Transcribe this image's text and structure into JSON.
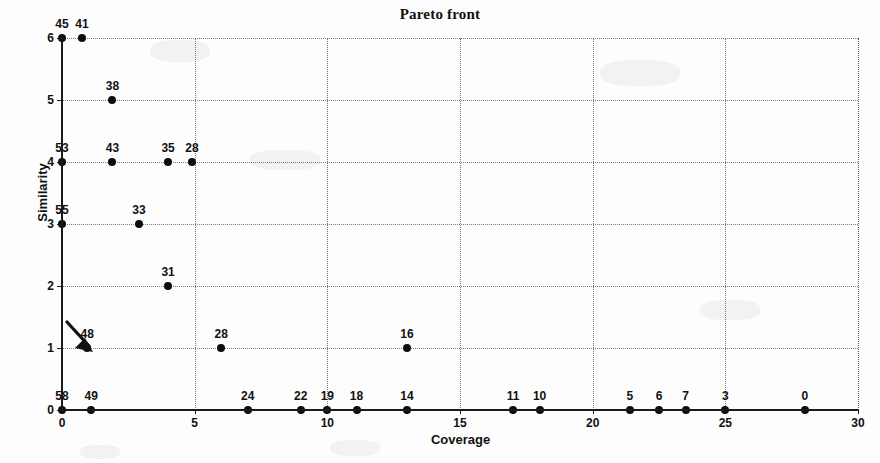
{
  "chart_data": {
    "type": "scatter",
    "title": "Pareto front",
    "xlabel": "Coverage",
    "ylabel": "Similarity",
    "xlim": [
      0,
      30
    ],
    "ylim": [
      0,
      6
    ],
    "xticks": [
      0,
      5,
      10,
      15,
      20,
      25,
      30
    ],
    "yticks": [
      0,
      1,
      2,
      3,
      4,
      5,
      6
    ],
    "xticklabels": [
      "0",
      "5",
      "10",
      "15",
      "20",
      "25",
      "30"
    ],
    "yticklabels": [
      "0",
      "1",
      "2",
      "3",
      "4",
      "5",
      "6"
    ],
    "grid": true,
    "grid_style": "dotted",
    "marker": "filled-circle",
    "marker_color": "#0d0d0d",
    "point_label_position": "above",
    "points": [
      {
        "label": "45",
        "x": 0,
        "y": 6
      },
      {
        "label": "41",
        "x": 0.75,
        "y": 6
      },
      {
        "label": "38",
        "x": 1.9,
        "y": 5
      },
      {
        "label": "53",
        "x": 0,
        "y": 4
      },
      {
        "label": "43",
        "x": 1.9,
        "y": 4
      },
      {
        "label": "35",
        "x": 4.0,
        "y": 4
      },
      {
        "label": "28",
        "x": 4.9,
        "y": 4
      },
      {
        "label": "55",
        "x": 0,
        "y": 3
      },
      {
        "label": "33",
        "x": 2.9,
        "y": 3
      },
      {
        "label": "31",
        "x": 4.0,
        "y": 2
      },
      {
        "label": "48",
        "x": 0.95,
        "y": 1
      },
      {
        "label": "28",
        "x": 6.0,
        "y": 1
      },
      {
        "label": "16",
        "x": 13.0,
        "y": 1
      },
      {
        "label": "58",
        "x": 0,
        "y": 0
      },
      {
        "label": "49",
        "x": 1.1,
        "y": 0
      },
      {
        "label": "24",
        "x": 7.0,
        "y": 0
      },
      {
        "label": "22",
        "x": 9.0,
        "y": 0
      },
      {
        "label": "19",
        "x": 10.0,
        "y": 0
      },
      {
        "label": "18",
        "x": 11.1,
        "y": 0
      },
      {
        "label": "14",
        "x": 13.0,
        "y": 0
      },
      {
        "label": "11",
        "x": 17.0,
        "y": 0
      },
      {
        "label": "10",
        "x": 18.0,
        "y": 0
      },
      {
        "label": "5",
        "x": 21.4,
        "y": 0
      },
      {
        "label": "6",
        "x": 22.5,
        "y": 0
      },
      {
        "label": "7",
        "x": 23.5,
        "y": 0
      },
      {
        "label": "3",
        "x": 25.0,
        "y": 0
      },
      {
        "label": "0",
        "x": 28.0,
        "y": 0
      }
    ],
    "annotations": [
      {
        "type": "arrow",
        "name": "pointer-arrow",
        "target_label": "48",
        "target_x": 0.95,
        "target_y": 1,
        "direction": "down-right"
      }
    ]
  }
}
